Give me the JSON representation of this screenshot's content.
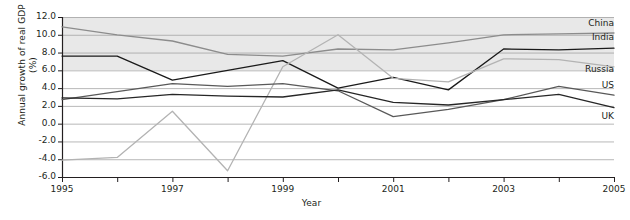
{
  "chart_data": {
    "type": "line",
    "title": "",
    "xlabel": "Year",
    "ylabel_line1": "Annual growth of real GDP",
    "ylabel_line2": "(%)",
    "x": [
      1995,
      1996,
      1997,
      1998,
      1999,
      2000,
      2001,
      2002,
      2003,
      2004,
      2005
    ],
    "xlim": [
      1995,
      2005
    ],
    "ylim": [
      -6.0,
      12.0
    ],
    "xticks": [
      1995,
      1997,
      1999,
      2001,
      2003,
      2005
    ],
    "xticklabels": [
      "1995",
      "1997",
      "1999",
      "2001",
      "2003",
      "2005"
    ],
    "xminorticks": [
      1996,
      1998,
      2000,
      2002,
      2004
    ],
    "yticks": [
      -6.0,
      -4.0,
      -2.0,
      0.0,
      2.0,
      4.0,
      6.0,
      8.0,
      10.0,
      12.0
    ],
    "yticklabels": [
      "-6.0",
      "-4.0",
      "-2.0",
      "0.0",
      "2.0",
      "4.0",
      "6.0",
      "8.0",
      "10.0",
      "12.0"
    ],
    "grid": "horizontal",
    "legend_position": "right-inline-labels",
    "band_shading": {
      "shaded_above": 6.0,
      "shaded_color": "#e8e8e8",
      "plain_color": "#ffffff"
    },
    "series": [
      {
        "name": "China",
        "color": "#8c8c8c",
        "width": 1.3,
        "label": "China",
        "label_value": 11.2,
        "values": [
          10.9,
          10.0,
          9.3,
          7.8,
          7.6,
          8.4,
          8.3,
          9.1,
          10.0,
          10.1,
          10.2
        ]
      },
      {
        "name": "India",
        "color": "#1a1a1a",
        "width": 1.3,
        "label": "India",
        "label_value": 9.6,
        "values": [
          7.6,
          7.6,
          4.9,
          6.0,
          7.1,
          4.0,
          5.2,
          3.8,
          8.4,
          8.3,
          8.5
        ]
      },
      {
        "name": "Russia",
        "color": "#b3b3b3",
        "width": 1.3,
        "label": "Russia",
        "label_value": 6.0,
        "values": [
          -4.1,
          -3.8,
          1.4,
          -5.3,
          6.4,
          10.0,
          5.1,
          4.7,
          7.3,
          7.2,
          6.4
        ]
      },
      {
        "name": "US",
        "color": "#595959",
        "width": 1.3,
        "label": "US",
        "label_value": 4.2,
        "values": [
          2.7,
          3.6,
          4.5,
          4.2,
          4.5,
          3.7,
          0.8,
          1.6,
          2.7,
          4.2,
          3.2
        ]
      },
      {
        "name": "UK",
        "color": "#262626",
        "width": 1.3,
        "label": "UK",
        "label_value": 0.7,
        "values": [
          2.9,
          2.8,
          3.3,
          3.1,
          3.0,
          3.8,
          2.4,
          2.1,
          2.7,
          3.3,
          1.8
        ]
      }
    ]
  },
  "plot_geometry": {
    "left": 62,
    "right": 614,
    "top": 17,
    "bottom": 177
  }
}
